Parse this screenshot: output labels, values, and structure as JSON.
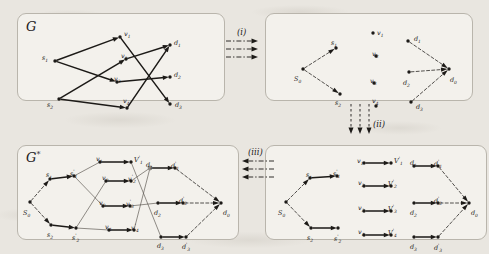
{
  "figure": {
    "background_color": "#e9e6e0",
    "panel_color": "#f3f1ec",
    "ink_color": "#1c1a17",
    "highlight_node_color": "#8d8a84"
  },
  "panels": [
    {
      "id": "panel-g",
      "label": "G",
      "label_sup": "",
      "description": "original graph",
      "nodes": [
        {
          "name": "s1",
          "label": "s",
          "sub": "1",
          "sup": "",
          "x": 37,
          "y": 47,
          "lx": 24,
          "ly": 41,
          "fill": "dark"
        },
        {
          "name": "s2",
          "label": "s",
          "sub": "2",
          "sup": "",
          "x": 41,
          "y": 85,
          "lx": 29,
          "ly": 88,
          "fill": "dark"
        },
        {
          "name": "v1",
          "label": "v",
          "sub": "1",
          "sup": "",
          "x": 102,
          "y": 23,
          "lx": 106,
          "ly": 17,
          "fill": "dark"
        },
        {
          "name": "v2",
          "label": "v",
          "sub": "2",
          "sup": "",
          "x": 108,
          "y": 45,
          "lx": 103,
          "ly": 39,
          "fill": "dark"
        },
        {
          "name": "v3",
          "label": "v",
          "sub": "3",
          "sup": "",
          "x": 99,
          "y": 68,
          "lx": 96,
          "ly": 62,
          "fill": "dark"
        },
        {
          "name": "v4",
          "label": "v",
          "sub": "4",
          "sup": "",
          "x": 109,
          "y": 94,
          "lx": 105,
          "ly": 84,
          "fill": "dark"
        },
        {
          "name": "d1",
          "label": "d",
          "sub": "1",
          "sup": "",
          "x": 152,
          "y": 31,
          "lx": 156,
          "ly": 26,
          "fill": "dark"
        },
        {
          "name": "d2",
          "label": "d",
          "sub": "2",
          "sup": "",
          "x": 152,
          "y": 63,
          "lx": 156,
          "ly": 58,
          "fill": "dark"
        },
        {
          "name": "d3",
          "label": "d",
          "sub": "3",
          "sup": "",
          "x": 152,
          "y": 90,
          "lx": 157,
          "ly": 88,
          "fill": "dark"
        }
      ],
      "edges": [
        {
          "from": "s1",
          "to": "v1",
          "style": "solid"
        },
        {
          "from": "s1",
          "to": "v3",
          "style": "solid"
        },
        {
          "from": "s2",
          "to": "v2",
          "style": "solid"
        },
        {
          "from": "s2",
          "to": "v4",
          "style": "solid"
        },
        {
          "from": "v1",
          "to": "d3",
          "style": "solid"
        },
        {
          "from": "v2",
          "to": "d1",
          "style": "solid"
        },
        {
          "from": "v3",
          "to": "d2",
          "style": "solid"
        },
        {
          "from": "v4",
          "to": "d1",
          "style": "solid"
        }
      ]
    },
    {
      "id": "panel-sd",
      "label": "",
      "description": "super source and super destination added",
      "nodes": [
        {
          "name": "s0",
          "label": "S",
          "sub": "0",
          "sup": "",
          "x": 37,
          "y": 55,
          "lx": 28,
          "ly": 62,
          "fill": "dark"
        },
        {
          "name": "s1",
          "label": "s",
          "sub": "1",
          "sup": "",
          "x": 70,
          "y": 34,
          "lx": 65,
          "ly": 26,
          "fill": "dark"
        },
        {
          "name": "s2",
          "label": "s",
          "sub": "2",
          "sup": "",
          "x": 74,
          "y": 80,
          "lx": 69,
          "ly": 86,
          "fill": "dark"
        },
        {
          "name": "v1",
          "label": "v",
          "sub": "1",
          "sup": "",
          "x": 107,
          "y": 19,
          "lx": 111,
          "ly": 16,
          "fill": "dark"
        },
        {
          "name": "v2",
          "label": "v",
          "sub": "2",
          "sup": "",
          "x": 110,
          "y": 42,
          "lx": 106,
          "ly": 37,
          "fill": "dark"
        },
        {
          "name": "v3",
          "label": "v",
          "sub": "3",
          "sup": "",
          "x": 108,
          "y": 69,
          "lx": 104,
          "ly": 64,
          "fill": "dark"
        },
        {
          "name": "v4",
          "label": "v",
          "sub": "4",
          "sup": "",
          "x": 110,
          "y": 92,
          "lx": 106,
          "ly": 84,
          "fill": "dark"
        },
        {
          "name": "d1",
          "label": "d",
          "sub": "1",
          "sup": "",
          "x": 142,
          "y": 27,
          "lx": 148,
          "ly": 22,
          "fill": "dark"
        },
        {
          "name": "d2",
          "label": "d",
          "sub": "2",
          "sup": "",
          "x": 143,
          "y": 58,
          "lx": 137,
          "ly": 66,
          "fill": "dark"
        },
        {
          "name": "d3",
          "label": "d",
          "sub": "3",
          "sup": "",
          "x": 145,
          "y": 88,
          "lx": 150,
          "ly": 90,
          "fill": "dark"
        },
        {
          "name": "d0",
          "label": "d",
          "sub": "0",
          "sup": "",
          "x": 183,
          "y": 55,
          "lx": 184,
          "ly": 63,
          "fill": "dark"
        }
      ],
      "edges": [
        {
          "from": "s0",
          "to": "s1",
          "style": "dashed"
        },
        {
          "from": "s0",
          "to": "s2",
          "style": "dashed"
        },
        {
          "from": "d1",
          "to": "d0",
          "style": "dashed"
        },
        {
          "from": "d2",
          "to": "d0",
          "style": "dashed"
        },
        {
          "from": "d3",
          "to": "d0",
          "style": "dashed"
        }
      ]
    },
    {
      "id": "panel-gstar",
      "label": "G",
      "label_sup": "*",
      "description": "node-split expanded graph",
      "nodes": [
        {
          "name": "s0",
          "label": "S",
          "sub": "0",
          "sup": "",
          "x": 12,
          "y": 56,
          "lx": 5,
          "ly": 64,
          "fill": "dark"
        },
        {
          "name": "s1",
          "label": "s",
          "sub": "1",
          "sup": "",
          "x": 32,
          "y": 33,
          "lx": 28,
          "ly": 26,
          "fill": "dark"
        },
        {
          "name": "s1p",
          "label": "s",
          "sub": "1",
          "sup": "'",
          "x": 56,
          "y": 30,
          "lx": 52,
          "ly": 24,
          "fill": "dark"
        },
        {
          "name": "s2",
          "label": "s",
          "sub": "2",
          "sup": "",
          "x": 33,
          "y": 79,
          "lx": 29,
          "ly": 86,
          "fill": "dark"
        },
        {
          "name": "s2p",
          "label": "s",
          "sub": "2",
          "sup": "'",
          "x": 58,
          "y": 82,
          "lx": 54,
          "ly": 88,
          "fill": "dark"
        },
        {
          "name": "v1",
          "label": "v",
          "sub": "1",
          "sup": "",
          "x": 82,
          "y": 16,
          "lx": 78,
          "ly": 10,
          "fill": "dark"
        },
        {
          "name": "v1p",
          "label": "V",
          "sub": "1",
          "sup": "'",
          "x": 113,
          "y": 16,
          "lx": 116,
          "ly": 10,
          "fill": "dark"
        },
        {
          "name": "v2",
          "label": "v",
          "sub": "2",
          "sup": "",
          "x": 88,
          "y": 35,
          "lx": 84,
          "ly": 29,
          "fill": "dark"
        },
        {
          "name": "v2p",
          "label": "v",
          "sub": "2",
          "sup": "'",
          "x": 113,
          "y": 35,
          "lx": 110,
          "ly": 29,
          "fill": "dark"
        },
        {
          "name": "v3",
          "label": "v",
          "sub": "3",
          "sup": "",
          "x": 85,
          "y": 60,
          "lx": 81,
          "ly": 54,
          "fill": "dark"
        },
        {
          "name": "v3p",
          "label": "v",
          "sub": "3",
          "sup": "'",
          "x": 112,
          "y": 60,
          "lx": 108,
          "ly": 54,
          "fill": "dark"
        },
        {
          "name": "v4",
          "label": "v",
          "sub": "4",
          "sup": "",
          "x": 91,
          "y": 84,
          "lx": 87,
          "ly": 78,
          "fill": "dark"
        },
        {
          "name": "v4p",
          "label": "v",
          "sub": "4",
          "sup": "'",
          "x": 116,
          "y": 84,
          "lx": 113,
          "ly": 78,
          "fill": "dark"
        },
        {
          "name": "d1",
          "label": "d",
          "sub": "1",
          "sup": "",
          "x": 132,
          "y": 22,
          "lx": 128,
          "ly": 16,
          "fill": "gray"
        },
        {
          "name": "d1p",
          "label": "d",
          "sub": "1",
          "sup": "'",
          "x": 157,
          "y": 22,
          "lx": 153,
          "ly": 16,
          "fill": "dark"
        },
        {
          "name": "d2",
          "label": "d",
          "sub": "2",
          "sup": "",
          "x": 140,
          "y": 57,
          "lx": 136,
          "ly": 64,
          "fill": "dark"
        },
        {
          "name": "d2p",
          "label": "d",
          "sub": "2",
          "sup": "'",
          "x": 165,
          "y": 57,
          "lx": 161,
          "ly": 51,
          "fill": "dark"
        },
        {
          "name": "d3",
          "label": "d",
          "sub": "3",
          "sup": "",
          "x": 143,
          "y": 91,
          "lx": 139,
          "ly": 97,
          "fill": "dark"
        },
        {
          "name": "d3p",
          "label": "d",
          "sub": "3",
          "sup": "'",
          "x": 168,
          "y": 91,
          "lx": 164,
          "ly": 97,
          "fill": "dark"
        },
        {
          "name": "d0",
          "label": "d",
          "sub": "0",
          "sup": "",
          "x": 203,
          "y": 57,
          "lx": 205,
          "ly": 64,
          "fill": "dark"
        }
      ],
      "edges": [
        {
          "from": "s0",
          "to": "s1",
          "style": "dashed"
        },
        {
          "from": "s0",
          "to": "s2",
          "style": "dashed"
        },
        {
          "from": "s1",
          "to": "s1p",
          "style": "solid"
        },
        {
          "from": "s2",
          "to": "s2p",
          "style": "solid"
        },
        {
          "from": "s1p",
          "to": "v1",
          "style": "thin"
        },
        {
          "from": "s1p",
          "to": "v3",
          "style": "thin"
        },
        {
          "from": "s2p",
          "to": "v2",
          "style": "thin"
        },
        {
          "from": "s2p",
          "to": "v4",
          "style": "thin"
        },
        {
          "from": "v1",
          "to": "v1p",
          "style": "solid"
        },
        {
          "from": "v2",
          "to": "v2p",
          "style": "solid"
        },
        {
          "from": "v3",
          "to": "v3p",
          "style": "solid"
        },
        {
          "from": "v4",
          "to": "v4p",
          "style": "solid"
        },
        {
          "from": "v1p",
          "to": "d3",
          "style": "thin"
        },
        {
          "from": "v2p",
          "to": "d1",
          "style": "thin"
        },
        {
          "from": "v3p",
          "to": "d2",
          "style": "thin"
        },
        {
          "from": "v4p",
          "to": "d1",
          "style": "thin"
        },
        {
          "from": "d1",
          "to": "d1p",
          "style": "solid"
        },
        {
          "from": "d2",
          "to": "d2p",
          "style": "solid"
        },
        {
          "from": "d3",
          "to": "d3p",
          "style": "solid"
        },
        {
          "from": "d1p",
          "to": "d0",
          "style": "dashed"
        },
        {
          "from": "d2p",
          "to": "d0",
          "style": "dashed"
        },
        {
          "from": "d3p",
          "to": "d0",
          "style": "dashed"
        }
      ]
    },
    {
      "id": "panel-split",
      "label": "",
      "description": "all nodes split into in/out pairs, internal edges removed",
      "nodes": [
        {
          "name": "s0",
          "label": "S",
          "sub": "0",
          "sup": "",
          "x": 20,
          "y": 56,
          "lx": 12,
          "ly": 64,
          "fill": "dark"
        },
        {
          "name": "s1",
          "label": "s",
          "sub": "1",
          "sup": "",
          "x": 44,
          "y": 32,
          "lx": 40,
          "ly": 26,
          "fill": "dark"
        },
        {
          "name": "s1p",
          "label": "s",
          "sub": "1",
          "sup": "'",
          "x": 71,
          "y": 30,
          "lx": 67,
          "ly": 24,
          "fill": "dark"
        },
        {
          "name": "s2",
          "label": "s",
          "sub": "2",
          "sup": "",
          "x": 45,
          "y": 82,
          "lx": 41,
          "ly": 89,
          "fill": "dark"
        },
        {
          "name": "s2p",
          "label": "s",
          "sub": "2",
          "sup": "'",
          "x": 72,
          "y": 82,
          "lx": 68,
          "ly": 89,
          "fill": "dark"
        },
        {
          "name": "v1",
          "label": "v",
          "sub": "1",
          "sup": "",
          "x": 98,
          "y": 17,
          "lx": 91,
          "ly": 12,
          "fill": "dark"
        },
        {
          "name": "v1p",
          "label": "V",
          "sub": "1",
          "sup": "'",
          "x": 125,
          "y": 17,
          "lx": 128,
          "ly": 11,
          "fill": "dark"
        },
        {
          "name": "v2",
          "label": "v",
          "sub": "2",
          "sup": "",
          "x": 98,
          "y": 40,
          "lx": 92,
          "ly": 34,
          "fill": "dark"
        },
        {
          "name": "v2p",
          "label": "V",
          "sub": "2",
          "sup": "'",
          "x": 125,
          "y": 40,
          "lx": 122,
          "ly": 34,
          "fill": "dark"
        },
        {
          "name": "v3",
          "label": "v",
          "sub": "3",
          "sup": "",
          "x": 98,
          "y": 65,
          "lx": 92,
          "ly": 59,
          "fill": "dark"
        },
        {
          "name": "v3p",
          "label": "V",
          "sub": "3",
          "sup": "'",
          "x": 125,
          "y": 65,
          "lx": 122,
          "ly": 59,
          "fill": "dark"
        },
        {
          "name": "v4",
          "label": "v",
          "sub": "4",
          "sup": "",
          "x": 98,
          "y": 89,
          "lx": 92,
          "ly": 83,
          "fill": "dark"
        },
        {
          "name": "v4p",
          "label": "V",
          "sub": "4",
          "sup": "'",
          "x": 125,
          "y": 89,
          "lx": 122,
          "ly": 83,
          "fill": "dark"
        },
        {
          "name": "d1",
          "label": "d",
          "sub": "1",
          "sup": "",
          "x": 148,
          "y": 20,
          "lx": 144,
          "ly": 14,
          "fill": "dark"
        },
        {
          "name": "d1p",
          "label": "d",
          "sub": "1",
          "sup": "'",
          "x": 172,
          "y": 20,
          "lx": 168,
          "ly": 14,
          "fill": "dark"
        },
        {
          "name": "d2",
          "label": "d",
          "sub": "2",
          "sup": "",
          "x": 148,
          "y": 57,
          "lx": 144,
          "ly": 64,
          "fill": "dark"
        },
        {
          "name": "d2p",
          "label": "d",
          "sub": "2",
          "sup": "'",
          "x": 172,
          "y": 57,
          "lx": 168,
          "ly": 51,
          "fill": "dark"
        },
        {
          "name": "d3",
          "label": "d",
          "sub": "3",
          "sup": "",
          "x": 148,
          "y": 91,
          "lx": 144,
          "ly": 98,
          "fill": "dark"
        },
        {
          "name": "d3p",
          "label": "d",
          "sub": "3",
          "sup": "'",
          "x": 172,
          "y": 91,
          "lx": 168,
          "ly": 98,
          "fill": "dark"
        },
        {
          "name": "d0",
          "label": "d",
          "sub": "0",
          "sup": "",
          "x": 203,
          "y": 57,
          "lx": 205,
          "ly": 64,
          "fill": "dark"
        }
      ],
      "edges": [
        {
          "from": "s0",
          "to": "s1",
          "style": "dashed"
        },
        {
          "from": "s0",
          "to": "s2",
          "style": "dashed"
        },
        {
          "from": "s1",
          "to": "s1p",
          "style": "solid"
        },
        {
          "from": "s2",
          "to": "s2p",
          "style": "solid"
        },
        {
          "from": "v1",
          "to": "v1p",
          "style": "solid"
        },
        {
          "from": "v2",
          "to": "v2p",
          "style": "solid"
        },
        {
          "from": "v3",
          "to": "v3p",
          "style": "solid"
        },
        {
          "from": "v4",
          "to": "v4p",
          "style": "solid"
        },
        {
          "from": "d1",
          "to": "d1p",
          "style": "solid"
        },
        {
          "from": "d2",
          "to": "d2p",
          "style": "solid"
        },
        {
          "from": "d3",
          "to": "d3p",
          "style": "solid"
        },
        {
          "from": "d1p",
          "to": "d0",
          "style": "dashed"
        },
        {
          "from": "d2p",
          "to": "d0",
          "style": "dashed"
        },
        {
          "from": "d3p",
          "to": "d0",
          "style": "dashed"
        }
      ]
    }
  ],
  "transitions": [
    {
      "id": "step-i",
      "label": "(i)",
      "direction": "right",
      "arrows": 3
    },
    {
      "id": "step-ii",
      "label": "(ii)",
      "direction": "down",
      "arrows": 3
    },
    {
      "id": "step-iii",
      "label": "(iii)",
      "direction": "left",
      "arrows": 3
    }
  ]
}
